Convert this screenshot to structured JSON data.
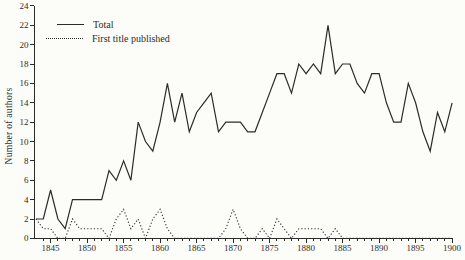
{
  "colors": {
    "line": "#2b2b2b",
    "text": "#2b2b2b",
    "background": "#fcfcf9"
  },
  "chart_data": {
    "type": "line",
    "title": "",
    "xlabel": "",
    "ylabel": "Number of authors",
    "grid": false,
    "legend_position": "top-left",
    "x_range": [
      1843,
      1900
    ],
    "ylim": [
      0,
      24
    ],
    "y_tick_step": 2,
    "y_ticks": [
      0,
      2,
      4,
      6,
      8,
      10,
      12,
      14,
      16,
      18,
      20,
      22,
      24
    ],
    "x_ticks_labeled": [
      1845,
      1850,
      1855,
      1860,
      1865,
      1870,
      1875,
      1880,
      1885,
      1890,
      1895,
      1900
    ],
    "x_minor_tick_every": 1,
    "x": [
      1843,
      1844,
      1845,
      1846,
      1847,
      1848,
      1849,
      1850,
      1851,
      1852,
      1853,
      1854,
      1855,
      1856,
      1857,
      1858,
      1859,
      1860,
      1861,
      1862,
      1863,
      1864,
      1865,
      1866,
      1867,
      1868,
      1869,
      1870,
      1871,
      1872,
      1873,
      1874,
      1875,
      1876,
      1877,
      1878,
      1879,
      1880,
      1881,
      1882,
      1883,
      1884,
      1885,
      1886,
      1887,
      1888,
      1889,
      1890,
      1891,
      1892,
      1893,
      1894,
      1895,
      1896,
      1897,
      1898,
      1899,
      1900
    ],
    "series": [
      {
        "name": "Total",
        "style": "solid",
        "values": [
          2,
          2,
          5,
          2,
          1,
          4,
          4,
          4,
          4,
          4,
          7,
          6,
          8,
          6,
          12,
          10,
          9,
          12,
          16,
          12,
          15,
          11,
          13,
          14,
          15,
          11,
          12,
          12,
          12,
          11,
          11,
          13,
          15,
          17,
          17,
          15,
          18,
          17,
          18,
          17,
          22,
          17,
          18,
          18,
          16,
          15,
          17,
          17,
          14,
          12,
          12,
          16,
          14,
          11,
          9,
          13,
          11,
          14
        ]
      },
      {
        "name": "First title published",
        "style": "dotted",
        "values": [
          2,
          1,
          1,
          0,
          0,
          2,
          1,
          1,
          1,
          1,
          0,
          2,
          3,
          1,
          2,
          0,
          2,
          3,
          1,
          0,
          0,
          0,
          0,
          0,
          0,
          0,
          1,
          3,
          1,
          0,
          0,
          1,
          0,
          2,
          1,
          0,
          1,
          1,
          1,
          1,
          0,
          1,
          0,
          0,
          0,
          0,
          0,
          0,
          0,
          0,
          0,
          0,
          0,
          0,
          0,
          0,
          0,
          0
        ]
      }
    ]
  }
}
